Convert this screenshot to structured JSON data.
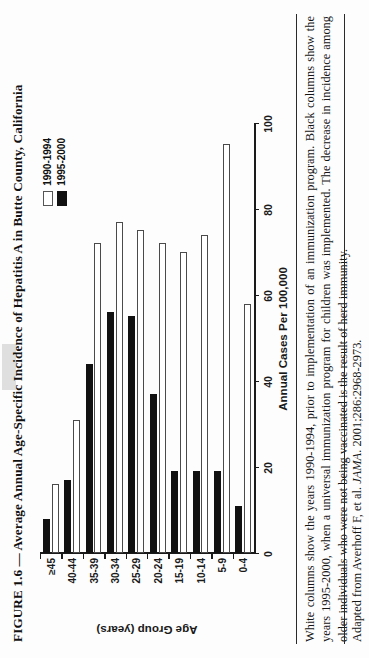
{
  "figure": {
    "title": "FIGURE 1.6 — Average Annual Age-Specific Incidence of Hepatitis A in Butte County, California",
    "caption": "White columns show the years 1990-1994, prior to implementation of an immunization program. Black columns show the years 1995-2000, when a universal immunization program for children was implemented. The decrease in incidence among older individuals who were not being vaccinated is the result of herd immunity.",
    "source_prefix": "Adapted from Averhoff F, et al. ",
    "source_journal": "JAMA",
    "source_suffix": ". 2001;286:2968-2973."
  },
  "colors": {
    "series_1990_1994": "#ffffff",
    "series_1995_2000": "#111111",
    "axis": "#1a1a1a",
    "page": "#fdfdfd",
    "scan_smudge": "#d9d9d9"
  },
  "chart_data": {
    "type": "bar",
    "orientation": "horizontal",
    "title": "Average Annual Age-Specific Incidence of Hepatitis A in Butte County, California",
    "xlabel": "Age Group (years)",
    "ylabel": "Annual Cases Per 100,000",
    "categories": [
      "0-4",
      "5-9",
      "10-14",
      "15-19",
      "20-24",
      "25-29",
      "30-34",
      "35-39",
      "40-44",
      "≥45"
    ],
    "ylim": [
      0,
      100
    ],
    "yticks": [
      0,
      20,
      40,
      60,
      80,
      100
    ],
    "ytick_labels": [
      "0",
      "20",
      "40",
      "60",
      "80",
      "100"
    ],
    "grid": false,
    "legend_position": "top-right",
    "series": [
      {
        "name": "1990-1994",
        "color": "#ffffff",
        "values": [
          58,
          95,
          74,
          70,
          72,
          75,
          77,
          72,
          31,
          16
        ]
      },
      {
        "name": "1995-2000",
        "color": "#111111",
        "values": [
          11,
          19,
          19,
          19,
          37,
          55,
          56,
          44,
          17,
          8
        ]
      }
    ]
  }
}
